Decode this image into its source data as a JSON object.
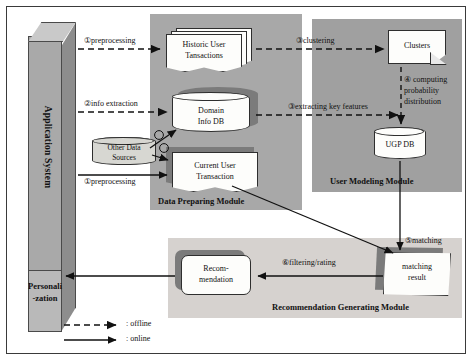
{
  "diagram": {
    "application_system": {
      "label": "Application System",
      "personalization_label": "Personali\n-zation"
    },
    "modules": [
      {
        "id": "data-preparing",
        "label": "Data Preparing Module"
      },
      {
        "id": "user-modeling",
        "label": "User Modeling Module"
      },
      {
        "id": "recommendation-generating",
        "label": "Recommendation Generating Module"
      }
    ],
    "nodes": [
      {
        "id": "historic-user-transactions",
        "label": "Historic User Tansactions",
        "shape": "document-stack"
      },
      {
        "id": "domain-info-db",
        "label": "Domain Info DB",
        "shape": "cylinder"
      },
      {
        "id": "other-data-sources",
        "label": "Other Data Sources",
        "shape": "cylinder"
      },
      {
        "id": "current-user-transaction",
        "label": "Current User Transaction",
        "shape": "document"
      },
      {
        "id": "clusters",
        "label": "Clusters",
        "shape": "note"
      },
      {
        "id": "ugp-db",
        "label": "UGP DB",
        "shape": "cylinder"
      },
      {
        "id": "matching-result",
        "label": "matching result",
        "shape": "skewed-box"
      },
      {
        "id": "recommendation",
        "label": "Recom- mendation",
        "shape": "rounded-box"
      }
    ],
    "edge_labels": {
      "preprocessing_1": "①preprocessing",
      "info_extraction_2": "②info extraction",
      "preprocessing_1b": "①preprocessing",
      "clustering_3": "③clustering",
      "extracting_key_features_3": "③extracting key features",
      "computing_probability_4": "④ computing probability distribution",
      "matching_5": "⑤matching",
      "filtering_rating_6": "⑥filtering/rating"
    },
    "node_text": {
      "historic_line1": "Historic User",
      "historic_line2": "Tansactions",
      "domain_line1": "Domain",
      "domain_line2": "Info DB",
      "other_line1": "Other Data",
      "other_line2": "Sources",
      "current_line1": "Current User",
      "current_line2": "Transaction",
      "clusters_line1": "Clusters",
      "ugp_line1": "UGP DB",
      "matching_line1": "matching",
      "matching_line2": "result",
      "rec_line1": "Recom-",
      "rec_line2": "mendation",
      "personal_line1": "Personali",
      "personal_line2": "-zation"
    },
    "legend": [
      {
        "id": "offline",
        "style": "dashed",
        "label": ": offline"
      },
      {
        "id": "online",
        "style": "solid",
        "label": ": online"
      }
    ],
    "colors": {
      "data_panel": "#a8a8a8",
      "user_panel": "#a0a0a0",
      "rec_panel": "#d6d2cf",
      "bar_front": "#a9a9a9",
      "bar_side": "#8d8d8d",
      "bar_top": "#c9c9c9",
      "shadow": "#7b7b7b",
      "node_fill": "#fdfdfb",
      "stroke": "#2e2e2e"
    }
  }
}
